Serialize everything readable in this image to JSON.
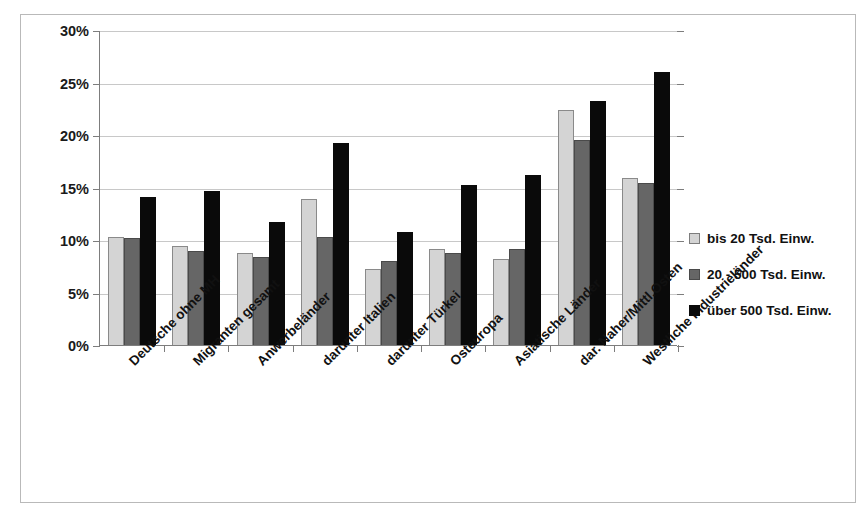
{
  "chart_data": {
    "type": "bar",
    "title": "",
    "subtitle": "",
    "xlabel": "",
    "ylabel": "",
    "ylim": [
      0,
      30
    ],
    "ytick_step": 5,
    "ytick_labels": [
      "0%",
      "5%",
      "10%",
      "15%",
      "20%",
      "25%",
      "30%"
    ],
    "ytick_values": [
      0,
      5,
      10,
      15,
      20,
      25,
      30
    ],
    "grid": true,
    "legend_position": "right",
    "value_unit": "%",
    "categories": [
      "Deutsche ohne MH",
      "Migranten gesamt",
      "Anwerbeländer",
      "darunter Italien",
      "darunter Türkei",
      "Osteuropa",
      "Asiatische Länder",
      "dar. Naher/Mittl.Osten",
      "Westliche Industrieländer"
    ],
    "series": [
      {
        "name": "bis 20 Tsd. Einw.",
        "color": "#d4d4d4",
        "values": [
          10.3,
          9.4,
          8.8,
          13.9,
          7.2,
          9.1,
          8.2,
          22.4,
          15.9
        ]
      },
      {
        "name": "20 - 500 Tsd. Einw.",
        "color": "#666666",
        "values": [
          10.2,
          9.0,
          8.4,
          10.3,
          8.0,
          8.8,
          9.1,
          19.5,
          15.4
        ]
      },
      {
        "name": "über 500 Tsd. Einw.",
        "color": "#0a0a0a",
        "values": [
          14.1,
          14.7,
          11.7,
          19.2,
          10.8,
          15.2,
          16.2,
          23.2,
          26.0
        ]
      }
    ]
  },
  "colors": {
    "series_light": "#d4d4d4",
    "series_mid": "#666666",
    "series_dark": "#0a0a0a",
    "grid": "#c8c8c8",
    "axis": "#7d7d7d",
    "frame": "#b9b9b9",
    "text": "#111111",
    "background": "#ffffff"
  }
}
